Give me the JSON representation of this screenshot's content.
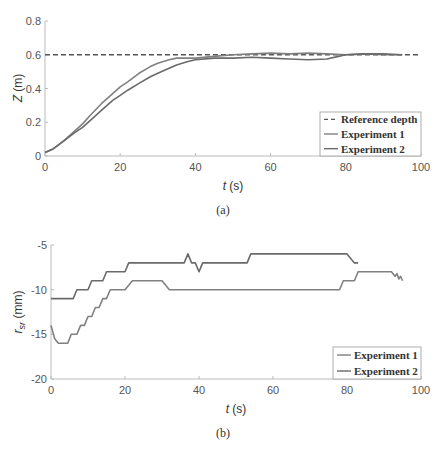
{
  "chart_data": [
    {
      "type": "line",
      "caption": "(a)",
      "title": "",
      "xlabel": "t (s)",
      "ylabel": "Z (m)",
      "xlim": [
        0,
        100
      ],
      "ylim": [
        0,
        0.8
      ],
      "xticks": [
        "0",
        "20",
        "40",
        "60",
        "80",
        "100"
      ],
      "yticks": [
        "0",
        "0.2",
        "0.4",
        "0.6",
        "0.8"
      ],
      "grid": false,
      "legend_position": "lower right",
      "series": [
        {
          "name": "Reference depth",
          "style": "dashed",
          "color": "#555555",
          "x": [
            0,
            100
          ],
          "y": [
            0.6,
            0.6
          ]
        },
        {
          "name": "Experiment 1",
          "style": "solid",
          "color": "#808080",
          "x": [
            0,
            2,
            5,
            8,
            10,
            12,
            15,
            18,
            20,
            22,
            25,
            28,
            30,
            33,
            35,
            40,
            45,
            50,
            55,
            60,
            65,
            70,
            75,
            80,
            85,
            90,
            95
          ],
          "y": [
            0.02,
            0.04,
            0.09,
            0.15,
            0.19,
            0.24,
            0.31,
            0.37,
            0.41,
            0.44,
            0.49,
            0.53,
            0.55,
            0.57,
            0.58,
            0.58,
            0.59,
            0.6,
            0.605,
            0.61,
            0.605,
            0.61,
            0.605,
            0.6,
            0.605,
            0.6,
            0.6
          ]
        },
        {
          "name": "Experiment 2",
          "style": "solid",
          "color": "#6a6a6a",
          "x": [
            0,
            2,
            5,
            8,
            10,
            12,
            15,
            18,
            20,
            22,
            25,
            28,
            30,
            33,
            35,
            38,
            40,
            45,
            50,
            55,
            60,
            65,
            70,
            75,
            78,
            80,
            85,
            90,
            95
          ],
          "y": [
            0.02,
            0.04,
            0.09,
            0.14,
            0.17,
            0.21,
            0.27,
            0.33,
            0.36,
            0.39,
            0.43,
            0.47,
            0.49,
            0.52,
            0.54,
            0.56,
            0.57,
            0.58,
            0.58,
            0.585,
            0.58,
            0.575,
            0.57,
            0.575,
            0.59,
            0.6,
            0.605,
            0.605,
            0.6
          ]
        }
      ]
    },
    {
      "type": "line",
      "caption": "(b)",
      "title": "",
      "xlabel": "t (s)",
      "ylabel": "r_sr (mm)",
      "xlim": [
        0,
        100
      ],
      "ylim": [
        -20,
        -5
      ],
      "xticks": [
        "0",
        "20",
        "40",
        "60",
        "80",
        "100"
      ],
      "yticks": [
        "-20",
        "-15",
        "-10",
        "-5"
      ],
      "grid": false,
      "legend_position": "lower right",
      "series": [
        {
          "name": "Experiment 1",
          "style": "solid",
          "color": "#808080",
          "x": [
            0,
            1,
            2,
            4.5,
            5.5,
            7,
            8,
            9,
            10,
            11,
            12,
            13,
            14,
            15,
            16,
            17,
            19,
            20,
            22,
            23,
            24,
            30,
            31,
            32,
            78,
            79,
            80,
            82,
            83,
            84,
            92,
            93,
            93.5,
            94,
            94.5,
            95
          ],
          "y": [
            -14,
            -15.5,
            -16,
            -16,
            -15,
            -15,
            -14,
            -14,
            -13,
            -13,
            -12,
            -12,
            -11,
            -11,
            -10,
            -10,
            -10,
            -10,
            -9,
            -9,
            -9,
            -9,
            -9.5,
            -10,
            -10,
            -9,
            -9,
            -9,
            -8,
            -8,
            -8,
            -8.5,
            -8.2,
            -8.8,
            -8.5,
            -9
          ]
        },
        {
          "name": "Experiment 2",
          "style": "solid",
          "color": "#6a6a6a",
          "x": [
            0,
            6,
            7,
            10,
            11,
            14,
            15,
            20,
            21,
            36,
            37,
            38,
            39,
            40,
            41,
            53,
            54,
            80,
            81,
            82,
            83
          ],
          "y": [
            -11,
            -11,
            -10,
            -10,
            -9,
            -9,
            -8,
            -8,
            -7,
            -7,
            -6,
            -7,
            -7,
            -8,
            -7,
            -7,
            -6,
            -6,
            -6.5,
            -7,
            -7
          ]
        }
      ]
    }
  ],
  "figure": {
    "panel_a": {
      "caption": "(a)",
      "xlabel_var": "t",
      "xlabel_unit": " (s)",
      "ylabel_var": "Z",
      "ylabel_unit": " (m)",
      "legend": [
        "Reference depth",
        "Experiment 1",
        "Experiment 2"
      ]
    },
    "panel_b": {
      "caption": "(b)",
      "xlabel_var": "t",
      "xlabel_unit": " (s)",
      "ylabel_var": "r",
      "ylabel_sub": "sr",
      "ylabel_unit": " (mm)",
      "legend": [
        "Experiment 1",
        "Experiment 2"
      ]
    }
  }
}
